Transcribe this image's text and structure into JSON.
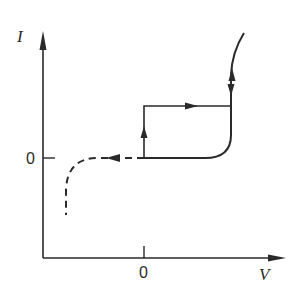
{
  "diagram": {
    "type": "I-V characteristic with hysteresis",
    "axes": {
      "y_label": "I",
      "x_label": "V",
      "y_origin_label": "0",
      "x_origin_label": "0"
    },
    "curves": [
      {
        "name": "solid-characteristic",
        "style": "solid",
        "description": "flat at I=0 from V=0, bends up sharply at positive V"
      },
      {
        "name": "switching-loop",
        "style": "solid",
        "description": "vertical jump at V=0 then horizontal to curve, arrows up and right"
      },
      {
        "name": "reverse-branch",
        "style": "dashed",
        "description": "from origin leftward with arrow, bending down at negative V"
      }
    ],
    "colors": {
      "line": "#2a2a2a",
      "background": "#ffffff"
    }
  }
}
